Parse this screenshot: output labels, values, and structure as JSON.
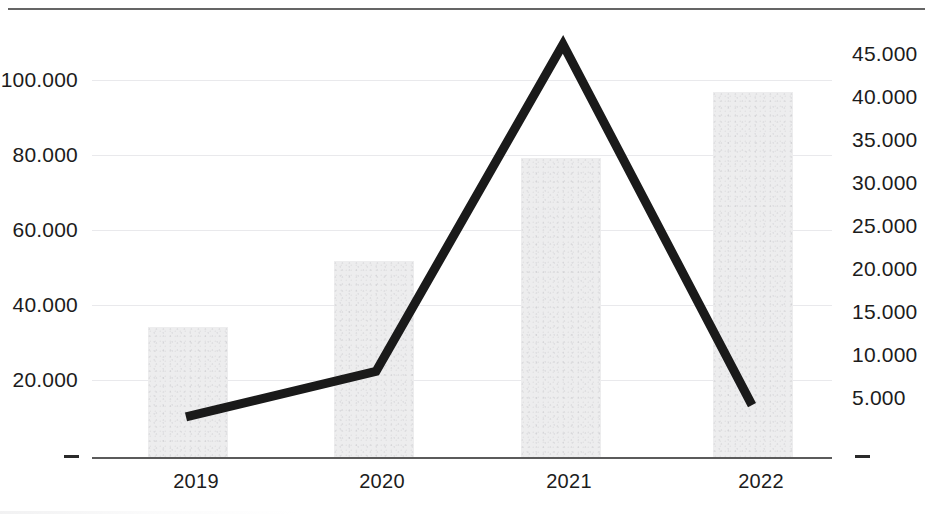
{
  "chart_data": {
    "type": "bar",
    "title": "",
    "subtitle": "",
    "xlabel": "",
    "ylabel": "",
    "categories": [
      "2019",
      "2020",
      "2021",
      "2022"
    ],
    "grid": true,
    "legend": null,
    "legend_position": "none",
    "axes": {
      "left": {
        "ylabel": "",
        "ylim": [
          0,
          110000
        ],
        "ticks": [
          0,
          20000,
          40000,
          60000,
          80000,
          100000
        ],
        "tick_labels": [
          "-",
          "20.000",
          "40.000",
          "60.000",
          "80.000",
          "100.000"
        ]
      },
      "right": {
        "ylabel": "",
        "ylim": [
          0,
          48000
        ],
        "ticks": [
          0,
          5000,
          10000,
          15000,
          20000,
          25000,
          30000,
          35000,
          40000,
          45000
        ],
        "tick_labels": [
          "-",
          "5.000",
          "10.000",
          "15.000",
          "20.000",
          "25.000",
          "30.000",
          "35.000",
          "40.000",
          "45.000"
        ]
      }
    },
    "series": [
      {
        "name": "Bars",
        "type": "bar",
        "axis": "left",
        "color": "#ededee",
        "values": [
          35000,
          52500,
          80000,
          97500
        ]
      },
      {
        "name": "Line",
        "type": "line",
        "axis": "right",
        "color": "#1a1a1a",
        "values": [
          4300,
          9400,
          46200,
          5600
        ]
      }
    ]
  },
  "colors": {
    "bar_fill": "#ededee",
    "line": "#1a1a1a",
    "gridline": "#e9e9ec",
    "axis": "#5b5b5b",
    "text": "#1c1c1c",
    "top_rule": "#4a4a4a"
  },
  "ticks_left": {
    "t0": "-",
    "t1": "20.000",
    "t2": "40.000",
    "t3": "60.000",
    "t4": "80.000",
    "t5": "100.000"
  },
  "ticks_right": {
    "t0": "-",
    "t1": "5.000",
    "t2": "10.000",
    "t3": "15.000",
    "t4": "20.000",
    "t5": "25.000",
    "t6": "30.000",
    "t7": "35.000",
    "t8": "40.000",
    "t9": "45.000"
  },
  "ticks_x": {
    "t0": "2019",
    "t1": "2020",
    "t2": "2021",
    "t3": "2022"
  }
}
